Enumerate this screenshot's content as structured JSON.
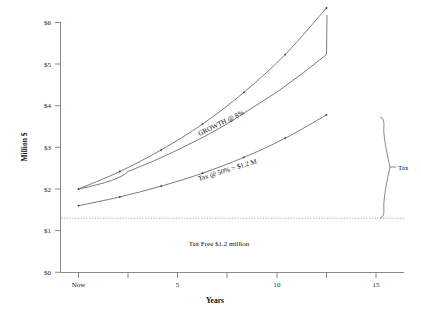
{
  "chart_data": {
    "type": "line",
    "title": "",
    "xlabel": "Years",
    "ylabel": "Million $",
    "xlim": [
      0,
      17
    ],
    "ylim": [
      0,
      6
    ],
    "grid": false,
    "legend": "none",
    "x_ticks": [
      {
        "value": 0,
        "label": "Now"
      },
      {
        "value": 2.5,
        "label": ""
      },
      {
        "value": 5,
        "label": "5"
      },
      {
        "value": 7.5,
        "label": ""
      },
      {
        "value": 10,
        "label": "10"
      },
      {
        "value": 12.5,
        "label": ""
      },
      {
        "value": 15,
        "label": "15"
      }
    ],
    "y_ticks": [
      {
        "value": 0,
        "label": "$0"
      },
      {
        "value": 1,
        "label": "$1"
      },
      {
        "value": 2,
        "label": "$2"
      },
      {
        "value": 3,
        "label": "$3"
      },
      {
        "value": 4,
        "label": "$4"
      },
      {
        "value": 5,
        "label": "$5"
      },
      {
        "value": 6,
        "label": "$6"
      }
    ],
    "series": [
      {
        "name": "GROWTH @ 8%",
        "x": [
          0,
          2.5,
          5,
          7.5,
          10,
          12.5,
          15
        ],
        "values": [
          2.0,
          2.42,
          2.94,
          3.56,
          4.32,
          5.23,
          6.35
        ]
      },
      {
        "name": "Tax @ 50% > $1.2 M",
        "x": [
          0,
          2.5,
          5,
          7.5,
          10,
          12.5,
          15
        ],
        "values": [
          1.6,
          1.81,
          2.07,
          2.38,
          2.76,
          3.22,
          3.78
        ]
      }
    ],
    "threshold_line": {
      "value": 1.3,
      "label": "Tax Free $1.2 million"
    },
    "annotations": [
      {
        "name": "growth-curve-label",
        "text": "GROWTH @ 8%"
      },
      {
        "name": "tax-curve-label",
        "text": "Tax @ 50% > $1.2 M"
      },
      {
        "name": "tax-free-label",
        "text": "Tax Free $1.2 million"
      },
      {
        "name": "tax-brace-label",
        "text": "Tax"
      }
    ]
  },
  "axes": {
    "y_title": "Million $",
    "x_title": "Years"
  },
  "labels": {
    "y0": "$0",
    "y1": "$1",
    "y2": "$2",
    "y3": "$3",
    "y4": "$4",
    "y5": "$5",
    "y6": "$6",
    "x_now": "Now",
    "x5": "5",
    "x10": "10",
    "x15": "15",
    "growth": "GROWTH @ 8%",
    "taxcurve": "Tax @ 50% > $1.2 M",
    "taxfree": "Tax Free $1.2 million",
    "tax": "Tax"
  },
  "colors": {
    "axis": "#8a8a8a",
    "curve": "#5a5a5a",
    "dotted": "#9a9a9a",
    "text": "#1a1a1a",
    "background": "#ffffff"
  }
}
